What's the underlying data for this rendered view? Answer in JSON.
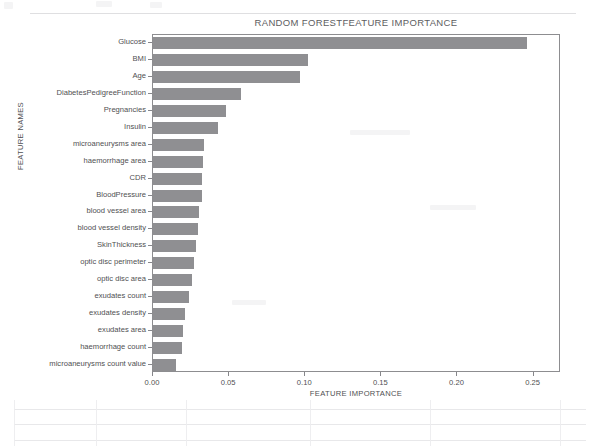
{
  "chart_data": {
    "type": "bar",
    "orientation": "horizontal",
    "title": "RANDOM FORESTFEATURE IMPORTANCE",
    "xlabel": "FEATURE IMPORTANCE",
    "ylabel": "FEATURE NAMES",
    "xlim": [
      0.0,
      0.268
    ],
    "xticks": [
      0.0,
      0.05,
      0.1,
      0.15,
      0.2,
      0.25
    ],
    "xtick_labels": [
      "0.00",
      "0.05",
      "0.10",
      "0.15",
      "0.20",
      "0.25"
    ],
    "grid": false,
    "legend": null,
    "bar_color": "#8f8f92",
    "categories": [
      "Glucose",
      "BMI",
      "Age",
      "DiabetesPedigreeFunction",
      "Pregnancies",
      "Insulin",
      "microaneurysms area",
      "haemorrhage area",
      "CDR",
      "BloodPressure",
      "blood vessel area",
      "blood vessel density",
      "SkinThickness",
      "optic disc perimeter",
      "optic disc area",
      "exudates count",
      "exudates density",
      "exudates area",
      "haemorrhage count",
      "microaneurysms count value"
    ],
    "values": [
      0.2455,
      0.1015,
      0.0965,
      0.058,
      0.048,
      0.0425,
      0.0335,
      0.033,
      0.0325,
      0.032,
      0.03,
      0.0295,
      0.0285,
      0.027,
      0.0255,
      0.0235,
      0.021,
      0.02,
      0.019,
      0.015
    ]
  }
}
